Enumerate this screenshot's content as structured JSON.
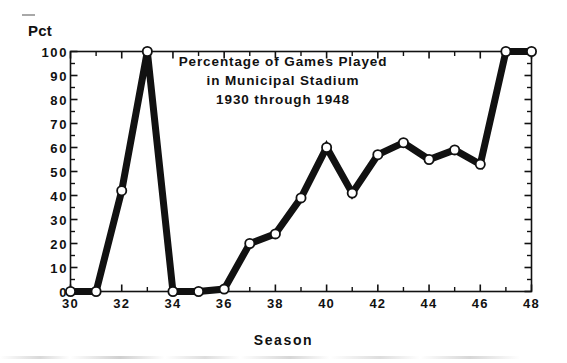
{
  "figure": {
    "kind": "scanned-line-chart",
    "ink_color": "#111111",
    "background_color": "#ffffff",
    "marker_fill": "#ffffff"
  },
  "labels": {
    "y_axis_title": "Pct",
    "x_axis_title": "Season",
    "title_line_1": "Percentage of Games Played",
    "title_line_2": "in Municipal Stadium",
    "title_line_3": "1930 through 1948"
  },
  "chart_data": {
    "type": "line",
    "title": "Percentage of Games Played in Municipal Stadium 1930 through 1948",
    "title_lines": [
      "Percentage of Games Played",
      "in Municipal Stadium",
      "1930 through 1948"
    ],
    "xlabel": "Season",
    "ylabel": "Pct",
    "xlim": [
      30,
      48
    ],
    "ylim": [
      0,
      100
    ],
    "grid": false,
    "legend": false,
    "x_tick_labels": [
      "30",
      "32",
      "34",
      "36",
      "38",
      "40",
      "42",
      "44",
      "46",
      "48"
    ],
    "x_tick_values": [
      30,
      32,
      34,
      36,
      38,
      40,
      42,
      44,
      46,
      48
    ],
    "x_minor_tick_values": [
      31,
      33,
      35,
      37,
      39,
      41,
      43,
      45,
      47
    ],
    "y_tick_labels": [
      "0",
      "10",
      "20",
      "30",
      "40",
      "50",
      "60",
      "70",
      "80",
      "90",
      "100"
    ],
    "y_tick_values": [
      0,
      10,
      20,
      30,
      40,
      50,
      60,
      70,
      80,
      90,
      100
    ],
    "marker": "open-circle",
    "line_width_px": 7,
    "x": [
      30,
      31,
      32,
      33,
      34,
      35,
      36,
      37,
      38,
      39,
      40,
      41,
      42,
      43,
      44,
      45,
      46,
      47,
      48
    ],
    "values": [
      0,
      0,
      42,
      100,
      0,
      0,
      1,
      20,
      24,
      39,
      60,
      41,
      57,
      62,
      55,
      59,
      53,
      100,
      100
    ],
    "series": [
      {
        "name": "Pct of games in Municipal Stadium",
        "x": [
          30,
          31,
          32,
          33,
          34,
          35,
          36,
          37,
          38,
          39,
          40,
          41,
          42,
          43,
          44,
          45,
          46,
          47,
          48
        ],
        "values": [
          0,
          0,
          42,
          100,
          0,
          0,
          1,
          20,
          24,
          39,
          60,
          41,
          57,
          62,
          55,
          59,
          53,
          100,
          100
        ]
      }
    ]
  }
}
